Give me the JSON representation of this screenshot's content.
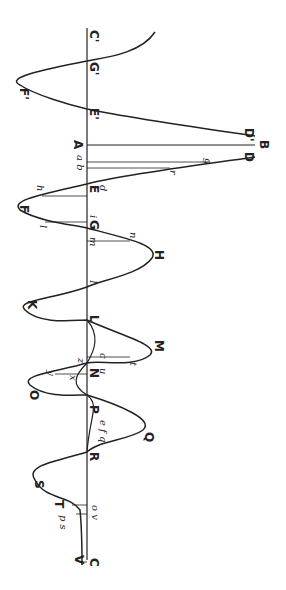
{
  "diagram": {
    "axis_labels": {
      "start": "C'",
      "A": "A",
      "end": "C",
      "B": "B"
    },
    "upper_curve_labels": [
      "G'",
      "F'",
      "E'",
      "D'"
    ],
    "main_points": [
      "D",
      "E",
      "F",
      "G",
      "H",
      "I",
      "K",
      "L",
      "M",
      "N",
      "O",
      "P",
      "Q",
      "R",
      "S",
      "T",
      "V"
    ],
    "small_labels": [
      "a",
      "b",
      "g",
      "r",
      "d",
      "h",
      "i",
      "l",
      "m",
      "n",
      "c",
      "t",
      "z",
      "u",
      "x",
      "y",
      "e",
      "f",
      "q",
      "o",
      "v",
      "p",
      "s"
    ]
  }
}
